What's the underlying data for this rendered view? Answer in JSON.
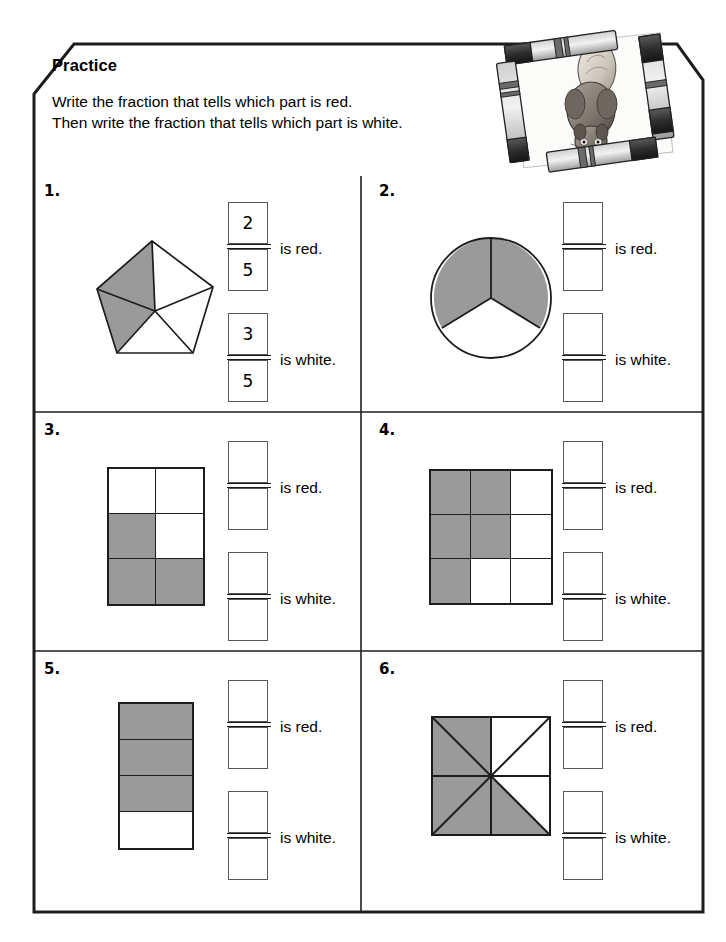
{
  "page": {
    "title": "Practice",
    "instruction_line_1": "Write the fraction that tells which part is red.",
    "instruction_line_2": "Then write the fraction that tells which part is white.",
    "red_fill_color": "#9a9a9a",
    "white_fill_color": "#ffffff",
    "line_color": "#1d1d1d",
    "box_border_color": "#58585a"
  },
  "artwork": {
    "name": "squirrel-drawing-framed-by-crayons",
    "description": "A pencil drawing of a squirrel surrounded by four crayons forming a frame"
  },
  "labels": {
    "is_red": "is red.",
    "is_white": "is white."
  },
  "problems": [
    {
      "number": "1.",
      "figure": "pentagon-five-triangles",
      "total_parts": 5,
      "red_parts": 2,
      "white_parts": 3,
      "red_answer": {
        "numerator": "2",
        "denominator": "5"
      },
      "white_answer": {
        "numerator": "3",
        "denominator": "5"
      }
    },
    {
      "number": "2.",
      "figure": "circle-thirds",
      "total_parts": 3,
      "red_parts": 2,
      "white_parts": 1,
      "red_answer": {
        "numerator": "",
        "denominator": ""
      },
      "white_answer": {
        "numerator": "",
        "denominator": ""
      }
    },
    {
      "number": "3.",
      "figure": "rectangle-2by3-grid",
      "total_parts": 6,
      "red_parts": 3,
      "white_parts": 3,
      "cells": [
        "white",
        "white",
        "red",
        "white",
        "red",
        "red"
      ],
      "columns": 2,
      "rows": 3,
      "red_answer": {
        "numerator": "",
        "denominator": ""
      },
      "white_answer": {
        "numerator": "",
        "denominator": ""
      }
    },
    {
      "number": "4.",
      "figure": "square-3by3-grid",
      "total_parts": 9,
      "red_parts": 5,
      "white_parts": 4,
      "cells": [
        "red",
        "red",
        "white",
        "red",
        "red",
        "white",
        "red",
        "white",
        "white"
      ],
      "columns": 3,
      "rows": 3,
      "red_answer": {
        "numerator": "",
        "denominator": ""
      },
      "white_answer": {
        "numerator": "",
        "denominator": ""
      }
    },
    {
      "number": "5.",
      "figure": "rectangle-four-horizontal-strips",
      "total_parts": 4,
      "red_parts": 3,
      "white_parts": 1,
      "cells": [
        "red",
        "red",
        "red",
        "white"
      ],
      "columns": 1,
      "rows": 4,
      "red_answer": {
        "numerator": "",
        "denominator": ""
      },
      "white_answer": {
        "numerator": "",
        "denominator": ""
      }
    },
    {
      "number": "6.",
      "figure": "square-eight-triangles-pinwheel",
      "total_parts": 8,
      "red_parts": 5,
      "white_parts": 3,
      "red_answer": {
        "numerator": "",
        "denominator": ""
      },
      "white_answer": {
        "numerator": "",
        "denominator": ""
      }
    }
  ]
}
